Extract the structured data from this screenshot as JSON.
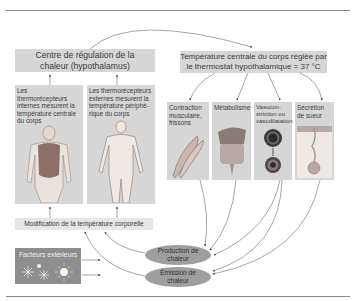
{
  "diagram": {
    "regulation_center": {
      "line1": "Centre de régulation de la",
      "line2": "chaleur (hypothalamus)"
    },
    "setpoint": {
      "line1": "Température centrale du corps réglée par",
      "line2": "le thermostat hypothalamique = 37 °C"
    },
    "receptors": [
      {
        "text": "Les thermorécepteurs internes mesurent la température centrale du corps",
        "illustration": "body-core-icon"
      },
      {
        "text": "Les thermorécepteurs externes mesurent la température périphé-rique du corps",
        "illustration": "body-skin-icon"
      }
    ],
    "effectors": [
      {
        "label": "Contraction musculaire, frissons",
        "illustration": "muscle-icon"
      },
      {
        "label": "Métabolisme",
        "illustration": "digestive-organs-icon"
      },
      {
        "label": "Vasocon-striction ou vasodilatation",
        "illustration": "blood-vessel-icon"
      },
      {
        "label": "Sécrétion de sueur",
        "illustration": "sweat-gland-icon"
      }
    ],
    "modification": "Modification de la température corporelle",
    "external_factors": {
      "label": "Facteurs extérieurs",
      "icons": [
        "snowflake-icon",
        "snowflake-icon",
        "sun-icon"
      ]
    },
    "outputs": {
      "production_line1": "Production de",
      "production_line2": "chaleur",
      "emission_line1": "Émission de",
      "emission_line2": "chaleur"
    }
  },
  "colors": {
    "box_fill": "#d6d6d6",
    "ellipse_fill": "#9e9e9e",
    "external_box_fill": "#8e8e8e",
    "arrow": "#5a5a5a"
  }
}
